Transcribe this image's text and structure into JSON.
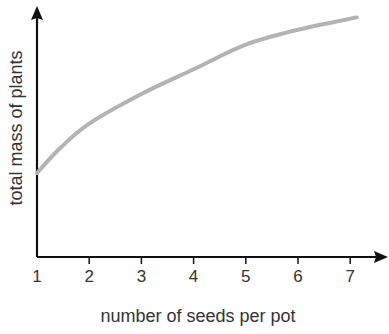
{
  "chart_data": {
    "type": "line",
    "title": "",
    "xlabel": "number of seeds per pot",
    "ylabel": "total mass of plants",
    "x_ticks": [
      "1",
      "2",
      "3",
      "4",
      "5",
      "6",
      "7"
    ],
    "xlim": [
      1,
      7.1
    ],
    "y_ticks": [],
    "grid": false,
    "legend": null,
    "series": [
      {
        "name": "total mass of plants",
        "color": "#b3b3b3",
        "x": [
          1,
          1.44,
          2,
          3,
          4,
          5,
          6,
          7.13
        ],
        "y_relative": [
          0.34,
          0.44,
          0.54,
          0.66,
          0.76,
          0.86,
          0.92,
          0.97
        ]
      }
    ]
  },
  "colors": {
    "axis": "#111111",
    "curve": "#b3b3b3",
    "text": "#333333"
  }
}
